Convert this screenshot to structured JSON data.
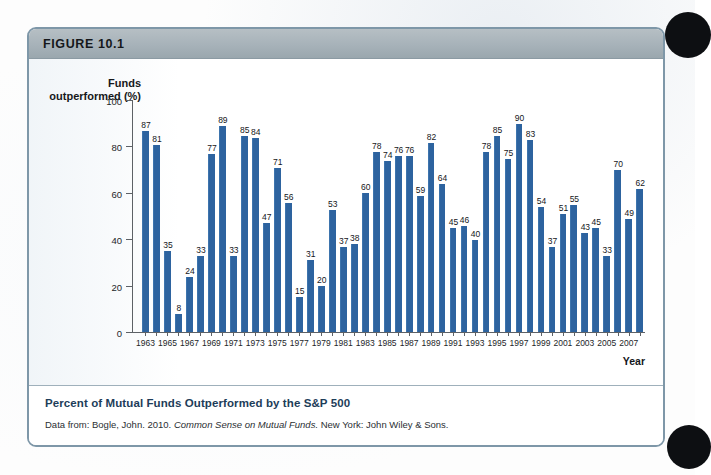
{
  "figure": {
    "header_label": "FIGURE 10.1",
    "caption_title": "Percent of Mutual Funds Outperformed by the S&P 500",
    "source_prefix": "Data from:",
    "source_author": "Bogle, John. 2010.",
    "source_work": "Common Sense on Mutual Funds.",
    "source_publisher": "New York: John Wiley & Sons."
  },
  "colors": {
    "bar": "#2d639f",
    "header_bar": "#a7b2b9",
    "box_border": "#7e97a8",
    "caption_title": "#1d3d59"
  },
  "chart_data": {
    "type": "bar",
    "title": "Percent of Mutual Funds Outperformed by the S&P 500",
    "xlabel": "Year",
    "ylabel": "Funds\noutperformed (%)",
    "ylim": [
      0,
      100
    ],
    "yticks": [
      0,
      20,
      40,
      60,
      80,
      100
    ],
    "grid": false,
    "legend": "none",
    "xtick_every": 2,
    "xtick_start_year": 1963,
    "categories": [
      1963,
      1964,
      1965,
      1966,
      1967,
      1968,
      1969,
      1970,
      1971,
      1972,
      1973,
      1974,
      1975,
      1976,
      1977,
      1978,
      1979,
      1980,
      1981,
      1982,
      1983,
      1984,
      1985,
      1986,
      1987,
      1988,
      1989,
      1990,
      1991,
      1992,
      1993,
      1994,
      1995,
      1996,
      1997,
      1998,
      1999,
      2000,
      2001,
      2002,
      2003,
      2004,
      2005,
      2006,
      2007,
      2008
    ],
    "values": [
      87,
      81,
      35,
      8,
      24,
      33,
      77,
      89,
      33,
      85,
      84,
      47,
      71,
      56,
      15,
      31,
      20,
      53,
      37,
      38,
      60,
      78,
      74,
      76,
      76,
      59,
      82,
      64,
      45,
      46,
      40,
      78,
      85,
      75,
      90,
      83,
      54,
      37,
      51,
      55,
      43,
      45,
      33,
      70,
      49,
      62
    ]
  }
}
